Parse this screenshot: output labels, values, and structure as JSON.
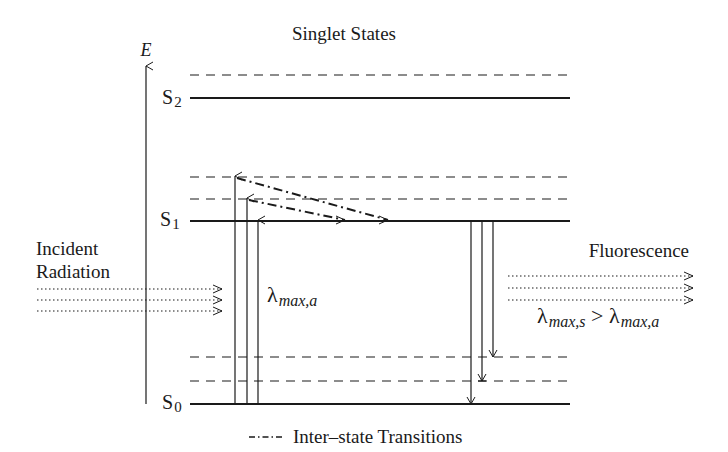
{
  "title": "Singlet States",
  "axis": {
    "label": "E"
  },
  "levels": {
    "s2": {
      "label": "S",
      "sub": "2"
    },
    "s1": {
      "label": "S",
      "sub": "1"
    },
    "s0": {
      "label": "S",
      "sub": "0"
    }
  },
  "incident": {
    "line1": "Incident",
    "line2": "Radiation"
  },
  "absorption": {
    "lambda": "λ",
    "sub": "max,a"
  },
  "fluorescence": {
    "label": "Fluorescence",
    "lambda1": "λ",
    "sub1": "max,s",
    "gt": " > ",
    "lambda2": "λ",
    "sub2": "max,a"
  },
  "legend": {
    "label": "Inter–state Transitions"
  },
  "colors": {
    "ink": "#1a1a1a",
    "background": "#ffffff"
  }
}
